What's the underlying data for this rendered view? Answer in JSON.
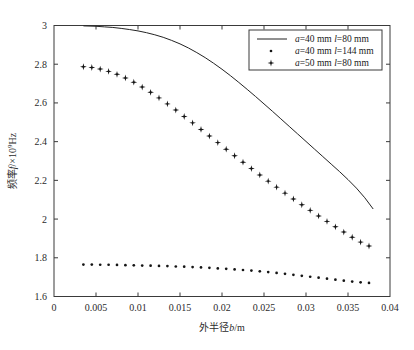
{
  "chart_data": {
    "type": "line",
    "title": "",
    "xlabel": "外半径b/m",
    "ylabel": "频率f/×10⁹Hz",
    "xlim": [
      0,
      0.04
    ],
    "ylim": [
      1.6,
      3.0
    ],
    "xticks": [
      "0",
      "0.005",
      "0.01",
      "0.015",
      "0.02",
      "0.025",
      "0.03",
      "0.035",
      "0.04"
    ],
    "xtick_values": [
      0,
      0.005,
      0.01,
      0.015,
      0.02,
      0.025,
      0.03,
      0.035,
      0.04
    ],
    "yticks": [
      "1.6",
      "1.8",
      "2",
      "2.2",
      "2.4",
      "2.6",
      "2.8",
      "3"
    ],
    "ytick_values": [
      1.6,
      1.8,
      2.0,
      2.2,
      2.4,
      2.6,
      2.8,
      3.0
    ],
    "grid": false,
    "legend_position": "upper-right",
    "series": [
      {
        "name": "a=40 mm l=80 mm",
        "style": "solid-line",
        "marker": "none",
        "x": [
          0.0035,
          0.005,
          0.006,
          0.007,
          0.008,
          0.009,
          0.01,
          0.011,
          0.012,
          0.013,
          0.014,
          0.015,
          0.016,
          0.017,
          0.018,
          0.019,
          0.02,
          0.021,
          0.022,
          0.023,
          0.024,
          0.025,
          0.026,
          0.027,
          0.028,
          0.029,
          0.03,
          0.031,
          0.032,
          0.033,
          0.034,
          0.035,
          0.036,
          0.037,
          0.038
        ],
        "values": [
          2.998,
          2.996,
          2.993,
          2.99,
          2.985,
          2.979,
          2.972,
          2.963,
          2.952,
          2.939,
          2.923,
          2.905,
          2.884,
          2.86,
          2.834,
          2.805,
          2.774,
          2.741,
          2.706,
          2.67,
          2.633,
          2.595,
          2.557,
          2.518,
          2.479,
          2.44,
          2.401,
          2.362,
          2.323,
          2.284,
          2.245,
          2.204,
          2.16,
          2.11,
          2.052
        ]
      },
      {
        "name": "a=40 mm l=144 mm",
        "style": "dotted-markers",
        "marker": "dot",
        "x": [
          0.0035,
          0.0045,
          0.0055,
          0.0065,
          0.0075,
          0.0085,
          0.0095,
          0.0105,
          0.0115,
          0.0125,
          0.0135,
          0.0145,
          0.0155,
          0.0165,
          0.0175,
          0.0185,
          0.0195,
          0.0205,
          0.0215,
          0.0225,
          0.0235,
          0.0245,
          0.0255,
          0.0265,
          0.0275,
          0.0285,
          0.0295,
          0.0305,
          0.0315,
          0.0325,
          0.0335,
          0.0345,
          0.0355,
          0.0365,
          0.0375
        ],
        "values": [
          1.765,
          1.765,
          1.764,
          1.764,
          1.763,
          1.762,
          1.761,
          1.76,
          1.759,
          1.758,
          1.757,
          1.755,
          1.754,
          1.752,
          1.75,
          1.748,
          1.745,
          1.743,
          1.74,
          1.737,
          1.734,
          1.73,
          1.726,
          1.722,
          1.717,
          1.712,
          1.707,
          1.702,
          1.697,
          1.692,
          1.687,
          1.682,
          1.677,
          1.673,
          1.67
        ]
      },
      {
        "name": "a=50 mm l=80 mm",
        "style": "star-markers",
        "marker": "star",
        "x": [
          0.0035,
          0.0045,
          0.0055,
          0.0065,
          0.0075,
          0.0085,
          0.0095,
          0.0105,
          0.0115,
          0.0125,
          0.0135,
          0.0145,
          0.0155,
          0.0165,
          0.0175,
          0.0185,
          0.0195,
          0.0205,
          0.0215,
          0.0225,
          0.0235,
          0.0245,
          0.0255,
          0.0265,
          0.0275,
          0.0285,
          0.0295,
          0.0305,
          0.0315,
          0.0325,
          0.0335,
          0.0345,
          0.0355,
          0.0365,
          0.0375
        ],
        "values": [
          2.787,
          2.783,
          2.775,
          2.763,
          2.748,
          2.729,
          2.707,
          2.682,
          2.655,
          2.626,
          2.595,
          2.563,
          2.53,
          2.497,
          2.463,
          2.429,
          2.395,
          2.361,
          2.327,
          2.294,
          2.261,
          2.228,
          2.196,
          2.165,
          2.134,
          2.104,
          2.074,
          2.045,
          2.016,
          1.988,
          1.96,
          1.933,
          1.906,
          1.881,
          1.861
        ]
      }
    ]
  },
  "legend": {
    "entries": [
      {
        "label": "a=40 mm l=80 mm",
        "a": "a",
        "eq1": "=40 mm ",
        "l": "l",
        "eq2": "=80 mm",
        "sample": "solid-line"
      },
      {
        "label": "a=40 mm l=144 mm",
        "a": "a",
        "eq1": "=40 mm ",
        "l": "l",
        "eq2": "=144 mm",
        "sample": "dot"
      },
      {
        "label": "a=50 mm l=80 mm",
        "a": "a",
        "eq1": "=50 mm ",
        "l": "l",
        "eq2": "=80 mm",
        "sample": "star"
      }
    ]
  },
  "axes": {
    "y_label_parts": {
      "main": "频率",
      "italic_f": "f",
      "unit": "/×10",
      "exp": "9",
      "hz": "Hz"
    },
    "x_label_parts": {
      "main": "外半径",
      "italic_b": "b",
      "unit": "/m"
    }
  },
  "colors": {
    "background": "#ffffff",
    "frame": "#3a3a3a",
    "series_line": "#232323",
    "marker": "#151515",
    "text": "#2b2b2b"
  }
}
